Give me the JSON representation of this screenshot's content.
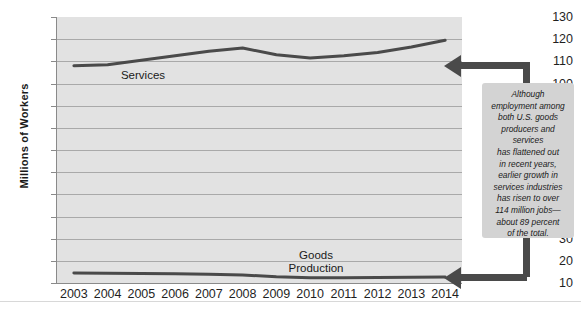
{
  "chart_data": {
    "type": "line",
    "title": "",
    "xlabel": "",
    "ylabel": "Millions of Workers",
    "categories": [
      "2003",
      "2004",
      "2005",
      "2006",
      "2007",
      "2008",
      "2009",
      "2010",
      "2011",
      "2012",
      "2013",
      "2014"
    ],
    "x": [
      2003,
      2004,
      2005,
      2006,
      2007,
      2008,
      2009,
      2010,
      2011,
      2012,
      2013,
      2014
    ],
    "ylim": [
      10,
      130
    ],
    "ytick_values": [
      130,
      120,
      110,
      100,
      90,
      80,
      70,
      60,
      50,
      40,
      30,
      20,
      10
    ],
    "ytick_labels": [
      "130",
      "120",
      "110",
      "100",
      "90",
      "80",
      "70",
      "60",
      "50",
      "40",
      "30",
      "20",
      "10"
    ],
    "grid": true,
    "legend_position": "inline-labels",
    "series": [
      {
        "name": "Services",
        "label": "Services",
        "color": "#4a4a4a",
        "values": [
          108,
          108.5,
          110.5,
          112.5,
          114.5,
          116,
          113,
          111.5,
          112.5,
          114,
          116.5,
          119.5
        ]
      },
      {
        "name": "Goods Production",
        "label_line1": "Goods",
        "label_line2": "Production",
        "color": "#4a4a4a",
        "values": [
          14.5,
          14.4,
          14.3,
          14.2,
          14.0,
          13.6,
          12.8,
          12.4,
          12.4,
          12.5,
          12.6,
          12.7
        ]
      }
    ]
  },
  "axis": {
    "y_title": "Millions of Workers"
  },
  "callout": {
    "lines": [
      "Although",
      "employment among",
      "both U.S. goods",
      "producers and",
      "services",
      "has flattened out",
      "in recent years,",
      "earlier growth in",
      "services industries",
      "has risen to over",
      "114 million jobs—",
      "about 89 percent",
      "of the total."
    ]
  },
  "colors": {
    "plot_background": "#e2e2e2",
    "gridline": "#a9a9a9",
    "series_line": "#4a4a4a",
    "callout_background": "#d3d3d3",
    "connector": "#4a4a4a",
    "text": "#1a1a1a"
  }
}
